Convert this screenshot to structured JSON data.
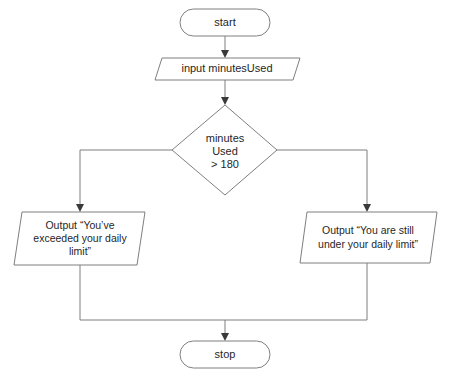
{
  "diagram": {
    "type": "flowchart",
    "background_color": "#ffffff",
    "stroke_color": "#7f7f7f",
    "text_color": "#1f1f1f",
    "arrow_color": "#3a3a3a"
  },
  "nodes": {
    "start": {
      "label": "start",
      "shape": "terminator"
    },
    "input": {
      "label": "input minutesUsed",
      "shape": "parallelogram"
    },
    "decision": {
      "line1": "minutes",
      "line2": "Used",
      "line3": "> 180",
      "shape": "diamond"
    },
    "output_exceeded": {
      "line1": "Output “You’ve",
      "line2": "exceeded your daily",
      "line3": "limit”",
      "shape": "parallelogram"
    },
    "output_under": {
      "line1": "Output “You are still",
      "line2": "under your daily limit”",
      "shape": "parallelogram"
    },
    "stop": {
      "label": "stop",
      "shape": "terminator"
    }
  },
  "edges": [
    {
      "from": "start",
      "to": "input",
      "label": ""
    },
    {
      "from": "input",
      "to": "decision",
      "label": ""
    },
    {
      "from": "decision",
      "to": "output_exceeded",
      "label": ""
    },
    {
      "from": "decision",
      "to": "output_under",
      "label": ""
    },
    {
      "from": "output_exceeded",
      "to": "stop",
      "label": ""
    },
    {
      "from": "output_under",
      "to": "stop",
      "label": ""
    }
  ]
}
